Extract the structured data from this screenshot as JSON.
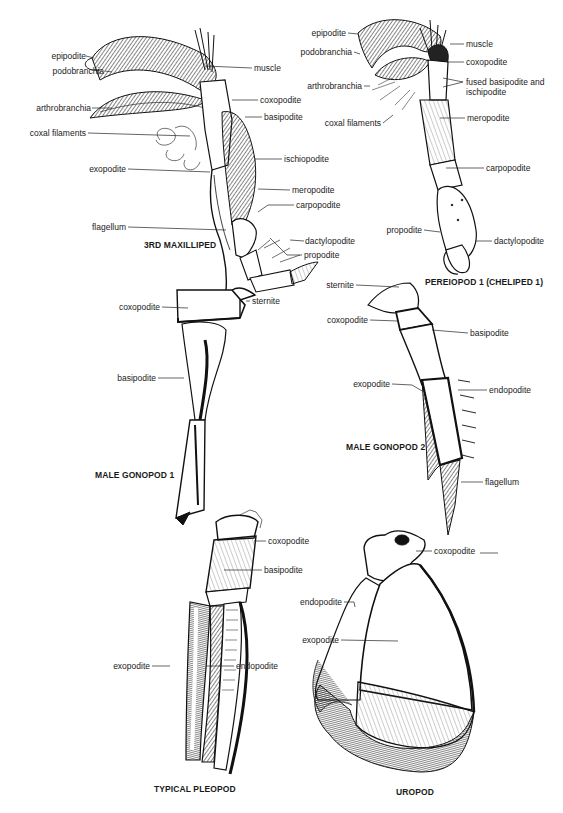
{
  "figures": [
    {
      "id": "maxilliped",
      "title": "3RD MAXILLIPED",
      "labels": {
        "epipodite": "epipodite",
        "podobranchia": "podobranchia",
        "muscle": "muscle",
        "coxopodite": "coxopodite",
        "arthrobranchia": "arthrobranchia",
        "basipodite": "basipodite",
        "coxal_filaments": "coxal filaments",
        "ischiopodite": "ischiopodite",
        "exopodite": "exopodite",
        "meropodite": "meropodite",
        "carpopodite": "carpopodite",
        "flagellum": "flagellum",
        "dactylopodite": "dactylopodite",
        "propodite": "propodite"
      }
    },
    {
      "id": "pereiopod",
      "title": "PEREIOPOD 1 (CHELIPED 1)",
      "labels": {
        "epipodite": "epipodite",
        "podobranchia": "podobranchia",
        "muscle": "muscle",
        "coxopodite": "coxopodite",
        "arthrobranchia": "arthrobranchia",
        "fused": "fused basipodite and",
        "fused2": "ischipodite",
        "coxal_filaments": "coxal filaments",
        "meropodite": "meropodite",
        "carpopodite": "carpopodite",
        "propodite": "propodite",
        "dactylopodite": "dactylopodite"
      }
    },
    {
      "id": "gonopod1",
      "title": "MALE GONOPOD 1",
      "labels": {
        "coxopodite": "coxopodite",
        "sternite": "sternite",
        "basipodite": "basipodite"
      }
    },
    {
      "id": "gonopod2",
      "title": "MALE GONOPOD 2",
      "labels": {
        "sternite": "sternite",
        "coxopodite": "coxopodite",
        "basipodite": "basipodite",
        "exopodite": "exopodite",
        "endopodite": "endopodite",
        "flagellum": "flagellum"
      }
    },
    {
      "id": "pleopod",
      "title": "TYPICAL PLEOPOD",
      "labels": {
        "coxopodite": "coxopodite",
        "basipodite": "basipodite",
        "exopodite": "exopodite",
        "endopodite": "endopodite"
      }
    },
    {
      "id": "uropod",
      "title": "UROPOD",
      "labels": {
        "coxopodite": "coxopodite",
        "endopodite": "endopodite",
        "exopodite": "exopodite"
      }
    }
  ]
}
